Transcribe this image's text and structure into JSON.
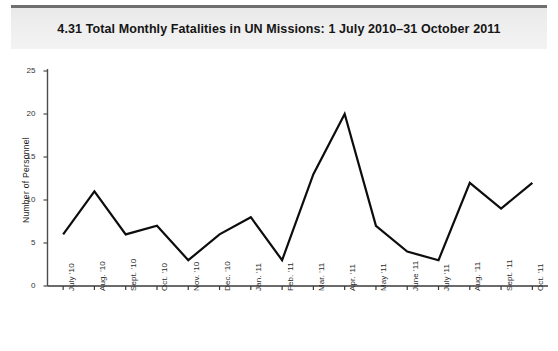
{
  "header": {
    "figure_number": "4.31",
    "title": "4.31  Total Monthly Fatalities in UN Missions: 1 July 2010–31 October 2011"
  },
  "chart_data": {
    "type": "line",
    "title": "4.31  Total Monthly Fatalities in UN Missions: 1 July 2010–31 October 2011",
    "xlabel": "",
    "ylabel": "Number of Personnel",
    "ylim": [
      0,
      25
    ],
    "yticks": [
      0,
      5,
      10,
      15,
      20,
      25
    ],
    "ytick_labels": [
      "0",
      "5",
      "10",
      "15",
      "20",
      "25"
    ],
    "grid": false,
    "legend": false,
    "line_color": "#0d0d0d",
    "categories": [
      "July '10",
      "Aug. '10",
      "Sept. '10",
      "Oct. '10",
      "Nov. '10",
      "Dec. '10",
      "Jan. '11",
      "Feb. '11",
      "Mar. '11",
      "Apr. '11",
      "May '11",
      "June '11",
      "July '11",
      "Aug. '11",
      "Sept. '11",
      "Oct. '11"
    ],
    "values": [
      6,
      11,
      6,
      7,
      3,
      6,
      8,
      3,
      13,
      20,
      7,
      4,
      3,
      12,
      9,
      12
    ]
  }
}
